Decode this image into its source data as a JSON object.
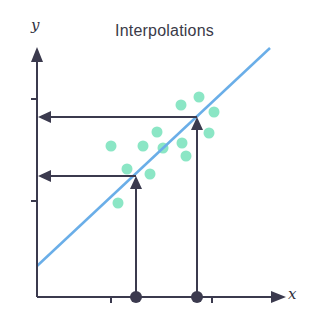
{
  "chart_data": {
    "type": "scatter",
    "title": "Interpolations",
    "xlabel": "x",
    "ylabel": "y",
    "grid": false,
    "legend": null,
    "x_ticks": 2,
    "y_ticks": 2,
    "scatter_points_px": [
      [
        111,
        146
      ],
      [
        143,
        146
      ],
      [
        157,
        132
      ],
      [
        163,
        148
      ],
      [
        182,
        143
      ],
      [
        181,
        105
      ],
      [
        199,
        97
      ],
      [
        214,
        112
      ],
      [
        209,
        133
      ],
      [
        186,
        156
      ],
      [
        127,
        169
      ],
      [
        150,
        174
      ],
      [
        118,
        203
      ]
    ],
    "trend_line_px": {
      "x1": 37,
      "y1": 266,
      "x2": 270,
      "y2": 48
    },
    "interpolations_px": [
      {
        "x": 136,
        "y": 176
      },
      {
        "x": 197,
        "y": 117
      }
    ],
    "colors": {
      "points": "#7ee3bf",
      "line": "#6aaee8",
      "axes": "#3b3a4e"
    }
  }
}
